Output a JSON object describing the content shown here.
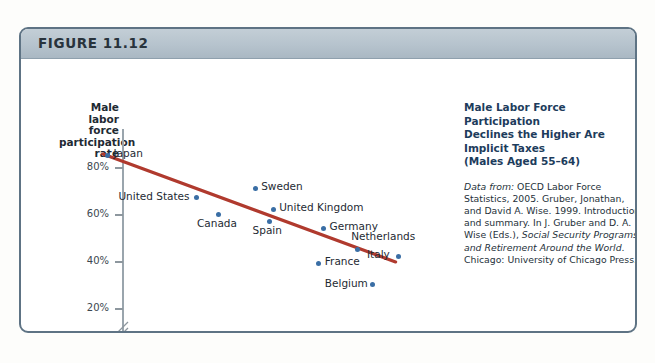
{
  "figure": {
    "label": "FIGURE 11.12"
  },
  "caption": {
    "title_line1": "Male Labor Force Participation",
    "title_line2": "Declines the Higher Are Implicit Taxes",
    "title_line3": "(Males Aged 55–64)",
    "source_prefix": "Data from:",
    "source_rest": " OECD Labor Force Statistics, 2005. Gruber, Jonathan, and David A. Wise. 1999. Introduction and summary. In J. Gruber and D. A. Wise (Eds.), ",
    "source_italic": "Social Security Programs and Retirement Around the World",
    "source_tail": ". Chicago: University of Chicago Press."
  },
  "chart_data": {
    "type": "scatter",
    "title": "Male Labor Force Participation Declines the Higher Are Implicit Taxes (Males Aged 55–64)",
    "xlabel": "Implicit tax index",
    "ylabel": "Male labor force participation rate",
    "ylabel_lines": [
      "Male",
      "labor force",
      "participation",
      "rate"
    ],
    "xlim": [
      -0.25,
      2.45
    ],
    "ylim": [
      18,
      90
    ],
    "y_axis_break": true,
    "grid": false,
    "legend": "none",
    "xticks": [
      0,
      0.5,
      1,
      1.5,
      2
    ],
    "xticklabels": [
      "0",
      "0.5",
      "1",
      "1.5",
      "2"
    ],
    "yticks": [
      20,
      40,
      60,
      80
    ],
    "yticklabels": [
      "20%",
      "40%",
      "60%",
      "80%"
    ],
    "point_color": "#3a6ea5",
    "trendline_color": "#b03a2e",
    "trendline": {
      "x": [
        -0.16,
        2.28
      ],
      "y": [
        85.5,
        39.6
      ]
    },
    "points": [
      {
        "label": "Japan",
        "x": -0.12,
        "y": 85,
        "label_dx": 6,
        "label_dy": -5
      },
      {
        "label": "United States",
        "x": 0.62,
        "y": 67,
        "label_dx": -78,
        "label_dy": -5
      },
      {
        "label": "Sweden",
        "x": 1.11,
        "y": 71,
        "label_dx": 6,
        "label_dy": -5
      },
      {
        "label": "Canada",
        "x": 0.8,
        "y": 60,
        "label_dx": -21,
        "label_dy": 6
      },
      {
        "label": "United Kingdom",
        "x": 1.26,
        "y": 62,
        "label_dx": 6,
        "label_dy": -5
      },
      {
        "label": "Spain",
        "x": 1.23,
        "y": 57,
        "label_dx": -17,
        "label_dy": 6
      },
      {
        "label": "Germany",
        "x": 1.68,
        "y": 54,
        "label_dx": 6,
        "label_dy": -5
      },
      {
        "label": "Netherlands",
        "x": 1.96,
        "y": 45,
        "label_dx": -6,
        "label_dy": -16
      },
      {
        "label": "Italy",
        "x": 2.3,
        "y": 42,
        "label_dx": -31,
        "label_dy": -5
      },
      {
        "label": "France",
        "x": 1.64,
        "y": 39,
        "label_dx": 6,
        "label_dy": -5
      },
      {
        "label": "Belgium",
        "x": 2.09,
        "y": 30,
        "label_dx": -48,
        "label_dy": -5
      }
    ]
  }
}
